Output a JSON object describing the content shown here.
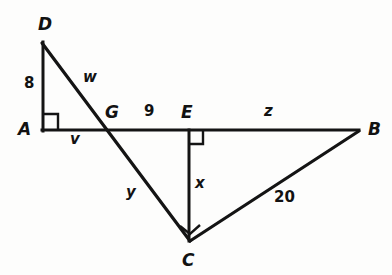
{
  "figure": {
    "stroke_color": "#141414",
    "background_color": "#fdfdfc",
    "vertices": [
      {
        "id": "D",
        "label": "D",
        "x": 42,
        "y": 42,
        "label_x": 38,
        "label_y": 16
      },
      {
        "id": "A",
        "label": "A",
        "x": 43,
        "y": 130,
        "label_x": 18,
        "label_y": 121
      },
      {
        "id": "G",
        "label": "G",
        "x": 113,
        "y": 130,
        "label_x": 105,
        "label_y": 104
      },
      {
        "id": "E",
        "label": "E",
        "x": 188,
        "y": 130,
        "label_x": 181,
        "label_y": 104
      },
      {
        "id": "B",
        "label": "B",
        "x": 358,
        "y": 130,
        "label_x": 368,
        "label_y": 121
      },
      {
        "id": "C",
        "label": "C",
        "x": 190,
        "y": 240,
        "label_x": 182,
        "label_y": 252
      }
    ],
    "segments": [
      {
        "id": "DA",
        "from": "D",
        "to": "A",
        "label": "8",
        "label_x": 24,
        "label_y": 76
      },
      {
        "id": "DC",
        "from": "D",
        "to": "C",
        "label": "w",
        "label_x": 83,
        "label_y": 70
      },
      {
        "id": "AG",
        "from": "A",
        "to": "G",
        "label": "v",
        "label_x": 70,
        "label_y": 132
      },
      {
        "id": "GE",
        "from": "G",
        "to": "E",
        "label": "9",
        "label_x": 144,
        "label_y": 104
      },
      {
        "id": "EB",
        "from": "E",
        "to": "B",
        "label": "z",
        "label_x": 264,
        "label_y": 104
      },
      {
        "id": "GC",
        "from": "G",
        "to": "C",
        "label": "y",
        "label_x": 126,
        "label_y": 185
      },
      {
        "id": "EC",
        "from": "E",
        "to": "C",
        "label": "x",
        "label_x": 195,
        "label_y": 176
      },
      {
        "id": "CB",
        "from": "C",
        "to": "B",
        "label": "20",
        "label_x": 274,
        "label_y": 190
      }
    ],
    "right_angles": [
      {
        "id": "right-angle-A",
        "at": "A"
      },
      {
        "id": "right-angle-E",
        "at": "E"
      },
      {
        "id": "right-angle-C",
        "at": "C"
      }
    ]
  }
}
